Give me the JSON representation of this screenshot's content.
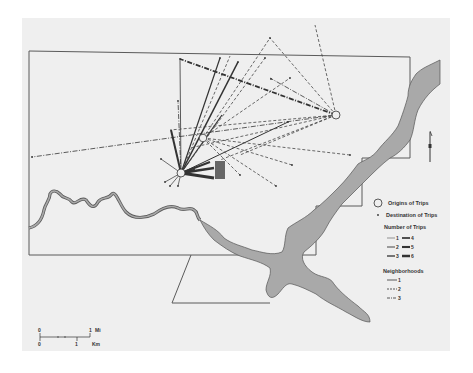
{
  "map": {
    "colors": {
      "background": "#efefef",
      "water": "#a9a9a9",
      "boundary": "#5a5a5a",
      "line": "#333333"
    },
    "north_arrow_label": "N",
    "origins": [
      {
        "id": "origin-1",
        "x": 181,
        "y": 173
      },
      {
        "id": "origin-2",
        "x": 203,
        "y": 138
      },
      {
        "id": "origin-3",
        "x": 336,
        "y": 115
      }
    ]
  },
  "legend": {
    "origins_label": "Origins of Trips",
    "destinations_label": "Destination of Trips",
    "number_of_trips_title": "Number of Trips",
    "trip_counts": [
      "1",
      "2",
      "3",
      "4",
      "5",
      "6"
    ],
    "neighborhoods_title": "Neighborhoods",
    "neighborhoods": [
      "1",
      "2",
      "3"
    ]
  },
  "scale": {
    "mi_zero": "0",
    "mi_one": "1",
    "mi_unit": "Mi",
    "km_zero": "0",
    "km_one": "1",
    "km_unit": "Km"
  }
}
